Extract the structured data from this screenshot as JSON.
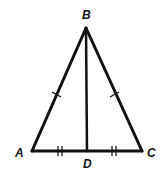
{
  "diagram": {
    "type": "isosceles-triangle-with-median",
    "colors": {
      "stroke": "#111111",
      "background": "#ffffff"
    },
    "vertices": {
      "A": {
        "label": "A",
        "x": 32,
        "y": 151
      },
      "B": {
        "label": "B",
        "x": 86,
        "y": 28
      },
      "C": {
        "label": "C",
        "x": 142,
        "y": 151
      },
      "D": {
        "label": "D",
        "x": 87,
        "y": 151
      }
    },
    "segments": [
      {
        "name": "AB",
        "from": "A",
        "to": "B",
        "ticks": 1
      },
      {
        "name": "BC",
        "from": "B",
        "to": "C",
        "ticks": 1
      },
      {
        "name": "AD",
        "from": "A",
        "to": "D",
        "ticks": 2
      },
      {
        "name": "DC",
        "from": "D",
        "to": "C",
        "ticks": 2
      },
      {
        "name": "BD",
        "from": "B",
        "to": "D",
        "ticks": 0
      }
    ],
    "labels": {
      "A": "A",
      "B": "B",
      "C": "C",
      "D": "D"
    }
  }
}
